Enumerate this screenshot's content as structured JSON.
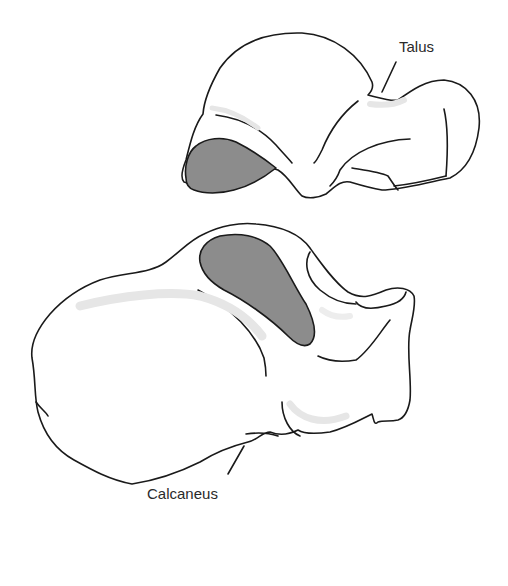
{
  "figure": {
    "type": "anatomical-illustration",
    "labels": {
      "talus": "Talus",
      "calcaneus": "Calcaneus"
    },
    "colors": {
      "outline": "#1a1a1a",
      "fill": "#ffffff",
      "articular_facet": "#8c8c8c",
      "shading": "#e8e8e8",
      "background": "#ffffff"
    }
  }
}
